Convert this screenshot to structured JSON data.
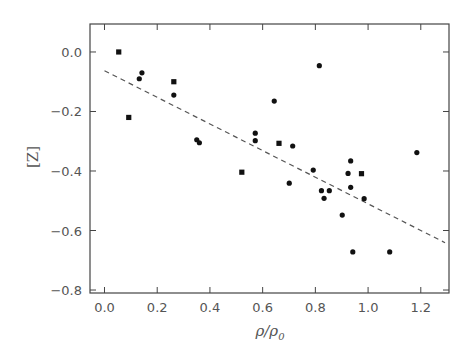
{
  "chart_data": {
    "type": "scatter",
    "title": "",
    "xlabel": "ρ/ρ",
    "xlabel_subscript": "0",
    "ylabel": "[Z]",
    "xlim": [
      -0.055,
      1.307
    ],
    "ylim": [
      -0.81,
      0.094
    ],
    "xticks": [
      0.0,
      0.2,
      0.4,
      0.6,
      0.8,
      1.0,
      1.2
    ],
    "xtick_labels": [
      "0.0",
      "0.2",
      "0.4",
      "0.6",
      "0.8",
      "1.0",
      "1.2"
    ],
    "yticks": [
      0.0,
      -0.2,
      -0.4,
      -0.6,
      -0.8
    ],
    "ytick_labels": [
      "0.0",
      "−0.2",
      "−0.4",
      "−0.6",
      "−0.8"
    ],
    "grid": false,
    "legend": null,
    "series": [
      {
        "name": "squares",
        "marker": "square",
        "color": "#111111",
        "points": [
          [
            0.054,
            0.0
          ],
          [
            0.092,
            -0.22
          ],
          [
            0.263,
            -0.1
          ],
          [
            0.521,
            -0.404
          ],
          [
            0.662,
            -0.307
          ],
          [
            0.975,
            -0.409
          ]
        ]
      },
      {
        "name": "circles",
        "marker": "circle",
        "color": "#111111",
        "points": [
          [
            0.142,
            -0.07
          ],
          [
            0.132,
            -0.09
          ],
          [
            0.263,
            -0.145
          ],
          [
            0.35,
            -0.295
          ],
          [
            0.36,
            -0.305
          ],
          [
            0.572,
            -0.273
          ],
          [
            0.572,
            -0.298
          ],
          [
            0.644,
            -0.165
          ],
          [
            0.701,
            -0.441
          ],
          [
            0.714,
            -0.316
          ],
          [
            0.792,
            -0.397
          ],
          [
            0.815,
            -0.046
          ],
          [
            0.823,
            -0.466
          ],
          [
            0.833,
            -0.492
          ],
          [
            0.853,
            -0.466
          ],
          [
            0.902,
            -0.548
          ],
          [
            0.924,
            -0.408
          ],
          [
            0.934,
            -0.366
          ],
          [
            0.934,
            -0.455
          ],
          [
            0.942,
            -0.672
          ],
          [
            0.985,
            -0.493
          ],
          [
            1.082,
            -0.672
          ],
          [
            1.185,
            -0.338
          ]
        ]
      },
      {
        "name": "fit",
        "type": "line",
        "style": "dashed",
        "color": "#555555",
        "points": [
          [
            0.0,
            -0.063
          ],
          [
            1.292,
            -0.641
          ]
        ]
      }
    ]
  },
  "colors": {
    "axis": "#444444",
    "text": "#555555",
    "marker": "#111111",
    "fit_line": "#555555"
  }
}
